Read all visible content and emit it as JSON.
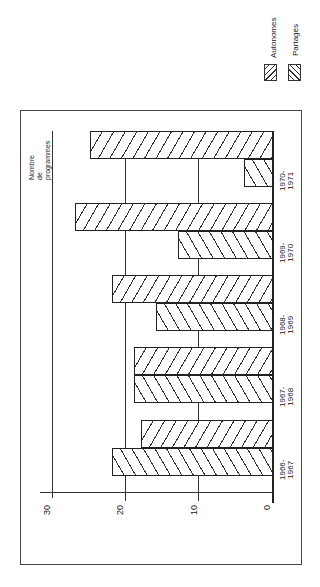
{
  "chart_data": {
    "type": "bar",
    "orientation": "rotated-90 (vertical bars printed sideways)",
    "title": "",
    "xlabel": "",
    "ylabel": "Nombre de programmes",
    "ylabel_lines": [
      "Nombre",
      "de",
      "programmes"
    ],
    "ylim": [
      0,
      30
    ],
    "yticks": [
      "0",
      "10",
      "20",
      "30"
    ],
    "grid": true,
    "legend_position": "top-right",
    "categories": [
      "1966-1967",
      "1967-1968",
      "1968-1969",
      "1969-1970",
      "1970-1971"
    ],
    "category_lines": [
      [
        "1966-",
        "1967"
      ],
      [
        "1967-",
        "1968"
      ],
      [
        "1968-",
        "1969"
      ],
      [
        "1969-",
        "1970"
      ],
      [
        "1970-",
        "1971"
      ]
    ],
    "series": [
      {
        "name": "Autonomes",
        "values": [
          22,
          19,
          16,
          13,
          4
        ]
      },
      {
        "name": "Partagés",
        "values": [
          18,
          19,
          22,
          27,
          25
        ]
      }
    ]
  },
  "legend": {
    "items": [
      {
        "label": "Autonomes"
      },
      {
        "label": "Partagés"
      }
    ]
  }
}
